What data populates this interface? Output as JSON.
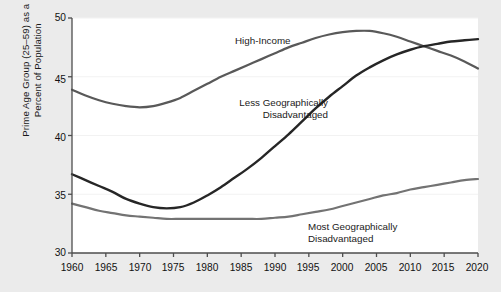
{
  "chart_data": {
    "type": "line",
    "title": "",
    "subtitle": "",
    "xlabel": "",
    "ylabel": "Prime Age Group (25–59) as a Percent of Population",
    "ylabel_lines": [
      "Prime Age Group (25–59) as a",
      "Percent of Population"
    ],
    "xlim": [
      1960,
      2020
    ],
    "ylim": [
      30,
      50
    ],
    "xticks": [
      1960,
      1965,
      1970,
      1975,
      1980,
      1985,
      1990,
      1995,
      2000,
      2005,
      2010,
      2015,
      2020
    ],
    "yticks": [
      30,
      35,
      40,
      45,
      50
    ],
    "grid": "horizontal",
    "legend_position": "inline-annotations",
    "x": [
      1960,
      1962,
      1964,
      1966,
      1968,
      1970,
      1972,
      1974,
      1976,
      1978,
      1980,
      1982,
      1984,
      1986,
      1988,
      1990,
      1992,
      1994,
      1996,
      1998,
      2000,
      2002,
      2004,
      2006,
      2008,
      2010,
      2012,
      2014,
      2016,
      2018,
      2020
    ],
    "series": [
      {
        "name": "High-Income",
        "color": "#595959",
        "width": 2.2,
        "label_anchor": "center",
        "values": [
          43.9,
          43.4,
          43.0,
          42.7,
          42.5,
          42.4,
          42.5,
          42.8,
          43.2,
          43.8,
          44.4,
          45.0,
          45.5,
          46.0,
          46.5,
          47.0,
          47.5,
          47.9,
          48.3,
          48.6,
          48.8,
          48.9,
          48.9,
          48.7,
          48.4,
          48.0,
          47.6,
          47.2,
          46.8,
          46.3,
          45.7
        ]
      },
      {
        "name": "Less Geographically Disadvantaged",
        "color": "#262626",
        "width": 2.4,
        "label_anchor": "right",
        "values": [
          36.7,
          36.2,
          35.7,
          35.2,
          34.6,
          34.2,
          33.9,
          33.8,
          33.9,
          34.3,
          34.9,
          35.6,
          36.4,
          37.2,
          38.1,
          39.1,
          40.1,
          41.2,
          42.3,
          43.3,
          44.2,
          45.1,
          45.8,
          46.4,
          46.9,
          47.3,
          47.6,
          47.8,
          48.0,
          48.1,
          48.2
        ]
      },
      {
        "name": "Most Geographically Disadvantaged",
        "color": "#737373",
        "width": 2.2,
        "label_anchor": "left",
        "values": [
          34.2,
          33.9,
          33.6,
          33.4,
          33.2,
          33.1,
          33.0,
          32.9,
          32.9,
          32.9,
          32.9,
          32.9,
          32.9,
          32.9,
          32.9,
          33.0,
          33.1,
          33.3,
          33.5,
          33.7,
          34.0,
          34.3,
          34.6,
          34.9,
          35.1,
          35.4,
          35.6,
          35.8,
          36.0,
          36.2,
          36.3
        ]
      }
    ],
    "annotations": [
      {
        "text": "High-Income",
        "lines": [
          "High-Income"
        ],
        "x": 1991,
        "y": 48.6
      },
      {
        "text": "Less Geographically Disadvantaged",
        "lines": [
          "Less Geographically",
          "Disadvantaged"
        ],
        "x": 1998,
        "y": 43.2
      },
      {
        "text": "Most Geographically Disadvantaged",
        "lines": [
          "Most Geographically",
          "Disadvantaged"
        ],
        "x": 2000,
        "y": 32.6
      }
    ]
  },
  "labels": {
    "ylabel_line1": "Prime Age Group (25–59) as a",
    "ylabel_line2": "Percent of Population",
    "high_income": "High-Income",
    "less_line1": "Less Geographically",
    "less_line2": "Disadvantaged",
    "most_line1": "Most Geographically",
    "most_line2": "Disadvantaged"
  },
  "ytick_labels": {
    "t0": "30",
    "t1": "35",
    "t2": "40",
    "t3": "45",
    "t4": "50"
  },
  "xtick_labels": {
    "t0": "1960",
    "t1": "1965",
    "t2": "1970",
    "t3": "1975",
    "t4": "1980",
    "t5": "1985",
    "t6": "1990",
    "t7": "1995",
    "t8": "2000",
    "t9": "2005",
    "t10": "2010",
    "t11": "2015",
    "t12": "2020"
  },
  "colors": {
    "background": "#ebebeb",
    "plot_background": "#ffffff",
    "axis": "#4d4d4d",
    "grid": "#f2f2f2",
    "text": "#1a1a1a",
    "series_high_income": "#595959",
    "series_less": "#262626",
    "series_most": "#737373"
  }
}
